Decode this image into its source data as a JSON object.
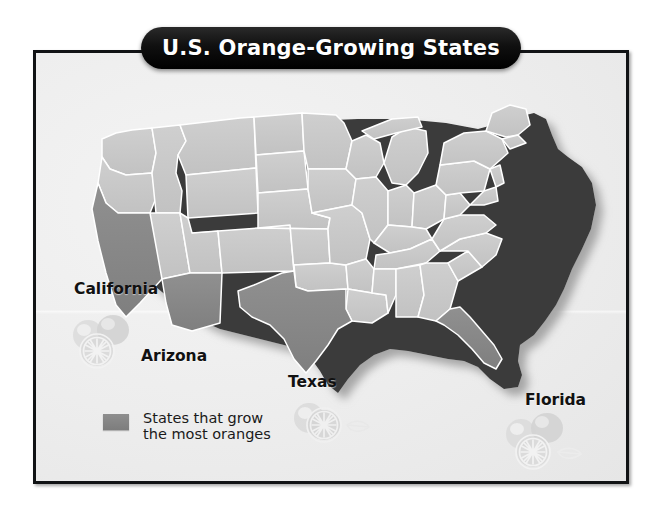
{
  "title": "U.S. Orange-Growing States",
  "map": {
    "type": "choropleth-map",
    "region": "United States (contiguous 48 states)",
    "state_labels": [
      {
        "id": "california",
        "label": "California"
      },
      {
        "id": "arizona",
        "label": "Arizona"
      },
      {
        "id": "texas",
        "label": "Texas"
      },
      {
        "id": "florida",
        "label": "Florida"
      }
    ],
    "highlighted_states": [
      "California",
      "Arizona",
      "Texas",
      "Florida"
    ],
    "orange_markers": [
      "California",
      "Texas",
      "Florida"
    ],
    "colors": {
      "highlight": "#8a8a8a",
      "state": "#c8c8c8",
      "border": "#ffffff",
      "extrude": "#3b3b3b",
      "background": "#efefef",
      "frame": "#111315",
      "banner": "#000000",
      "banner_text": "#ffffff",
      "label_text": "#111111"
    }
  },
  "legend": {
    "swatch_color": "#8a8a8a",
    "line1": "States that grow",
    "line2": "the most oranges"
  },
  "icons": {
    "orange_fruit": "orange-fruit-icon",
    "orange_slice": "orange-slice-icon",
    "leaf": "leaf-icon"
  }
}
